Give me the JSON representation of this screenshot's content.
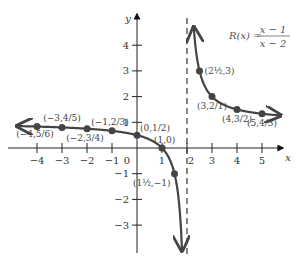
{
  "chart_data": {
    "type": "line",
    "title": "",
    "equation": {
      "lhs": "R(x) =",
      "numerator": "x − 1",
      "denominator": "x − 2"
    },
    "xlabel": "x",
    "ylabel": "y",
    "xlim": [
      -4.5,
      5.8
    ],
    "ylim": [
      -3.8,
      4.8
    ],
    "grid": false,
    "legend": "none",
    "vertical_asymptote": 2,
    "horizontal_asymptote": 1,
    "x_ticks": [
      -4,
      -3,
      -2,
      -1,
      0,
      1,
      2,
      3,
      4,
      5
    ],
    "x_tick_labels": [
      "−4",
      "−3",
      "−2",
      "−1",
      "0",
      "1",
      "2",
      "3",
      "4",
      "5"
    ],
    "y_ticks": [
      4,
      3,
      2,
      1,
      -1,
      -2,
      -3
    ],
    "y_tick_labels": [
      "4",
      "3",
      "2",
      "1",
      "−1",
      "−2",
      "−3"
    ],
    "points": [
      {
        "x": -4,
        "y": 0.8333,
        "label": "(−4,5/6)"
      },
      {
        "x": -3,
        "y": 0.8,
        "label": "(−3,4/5)"
      },
      {
        "x": -2,
        "y": 0.75,
        "label": "(−2,3/4)"
      },
      {
        "x": -1,
        "y": 0.6667,
        "label": "(−1,2/3)"
      },
      {
        "x": 0,
        "y": 0.5,
        "label": "(0,1/2)"
      },
      {
        "x": 1,
        "y": 0,
        "label": "(1,0)"
      },
      {
        "x": 1.5,
        "y": -1,
        "label": "(1½,−1)"
      },
      {
        "x": 2.5,
        "y": 3,
        "label": "(2½,3)"
      },
      {
        "x": 3,
        "y": 2,
        "label": "(3,2/1)"
      },
      {
        "x": 4,
        "y": 1.5,
        "label": "(4,3/2)"
      },
      {
        "x": 5,
        "y": 1.3333,
        "label": "(5,4/3)"
      }
    ]
  }
}
